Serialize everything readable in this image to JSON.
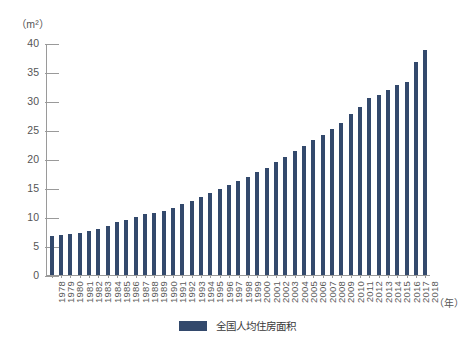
{
  "chart_data": {
    "type": "bar",
    "title": "",
    "subtitle": "",
    "unit_label": "（m²）",
    "xlabel": "（年）",
    "ylabel": "",
    "ylim": [
      0,
      40
    ],
    "ytick_step": 5,
    "yticks": [
      "0",
      "5",
      "10",
      "15",
      "20",
      "25",
      "30",
      "35",
      "40"
    ],
    "grid": false,
    "legend_position": "bottom-center",
    "legend": [
      "全国人均住房面积"
    ],
    "series_color": "#33496c",
    "categories": [
      "1978",
      "1979",
      "1980",
      "1981",
      "1982",
      "1983",
      "1984",
      "1985",
      "1986",
      "1987",
      "1988",
      "1989",
      "1990",
      "1991",
      "1992",
      "1993",
      "1994",
      "1995",
      "1996",
      "1997",
      "1998",
      "1999",
      "2000",
      "2001",
      "2002",
      "2003",
      "2004",
      "2005",
      "2006",
      "2007",
      "2008",
      "2009",
      "2010",
      "2011",
      "2012",
      "2013",
      "2014",
      "2015",
      "2016",
      "2017",
      "2018"
    ],
    "series": [
      {
        "name": "全国人均住房面积",
        "values": [
          6.7,
          7.0,
          7.1,
          7.3,
          7.6,
          8.0,
          8.5,
          9.1,
          9.6,
          10.1,
          10.6,
          10.8,
          11.1,
          11.6,
          12.3,
          12.9,
          13.5,
          14.2,
          14.9,
          15.6,
          16.3,
          17.0,
          17.8,
          18.6,
          19.6,
          20.5,
          21.4,
          22.3,
          23.3,
          24.3,
          25.3,
          26.3,
          27.8,
          29.1,
          30.6,
          31.2,
          32.1,
          32.9,
          33.5,
          36.9,
          39.0
        ]
      }
    ]
  }
}
